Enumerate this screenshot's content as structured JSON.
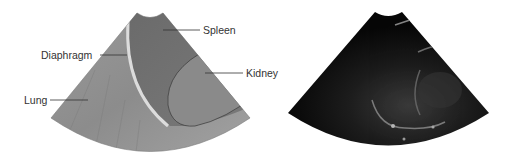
{
  "diagram": {
    "labels": {
      "spleen": "Spleen",
      "diaphragm": "Diaphragm",
      "kidney": "Kidney",
      "lung": "Lung"
    },
    "colors": {
      "fan_fill": "#8c8c8c",
      "spleen_fill": "#6f6f6f",
      "kidney_fill": "#8a8a8a",
      "diaphragm_line": "#d8d8d8",
      "leader_line": "#333333",
      "ultrasound_bg": "#0a0a0a"
    }
  }
}
